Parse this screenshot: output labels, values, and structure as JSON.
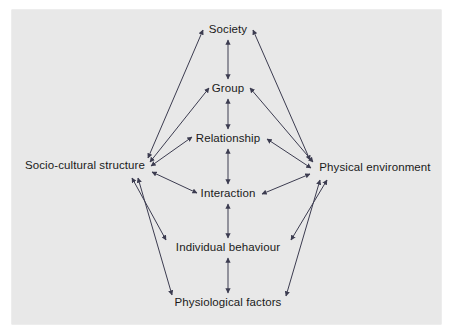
{
  "figure": {
    "type": "influence-diagram",
    "title": "",
    "background_color": "#e8e8e8",
    "page_color": "#ffffff",
    "line_color": "#3c3c50",
    "text_color": "#1a1a1a"
  },
  "nodes": [
    {
      "id": "society",
      "label": "Society",
      "x": 228,
      "y": 30,
      "column": "center"
    },
    {
      "id": "group",
      "label": "Group",
      "x": 228,
      "y": 89,
      "column": "center"
    },
    {
      "id": "relationship",
      "label": "Relationship",
      "x": 228,
      "y": 139,
      "column": "center"
    },
    {
      "id": "socio",
      "label": "Socio-cultural structure",
      "x": 85,
      "y": 166,
      "column": "left"
    },
    {
      "id": "physical",
      "label": "Physical environment",
      "x": 375,
      "y": 168,
      "column": "right"
    },
    {
      "id": "interaction",
      "label": "Interaction",
      "x": 228,
      "y": 194,
      "column": "center"
    },
    {
      "id": "individual",
      "label": "Individual behaviour",
      "x": 228,
      "y": 248,
      "column": "center"
    },
    {
      "id": "physiology",
      "label": "Physiological factors",
      "x": 228,
      "y": 303,
      "column": "center"
    }
  ],
  "edges": [
    {
      "from": "society",
      "to": "group",
      "arrow": "double",
      "kind": "vertical"
    },
    {
      "from": "group",
      "to": "relationship",
      "arrow": "double",
      "kind": "vertical"
    },
    {
      "from": "relationship",
      "to": "interaction",
      "arrow": "double",
      "kind": "vertical"
    },
    {
      "from": "interaction",
      "to": "individual",
      "arrow": "double",
      "kind": "vertical"
    },
    {
      "from": "individual",
      "to": "physiology",
      "arrow": "double",
      "kind": "vertical"
    },
    {
      "from": "socio",
      "to": "society",
      "arrow": "double",
      "kind": "diagonal"
    },
    {
      "from": "socio",
      "to": "group",
      "arrow": "double",
      "kind": "diagonal"
    },
    {
      "from": "socio",
      "to": "relationship",
      "arrow": "double",
      "kind": "diagonal"
    },
    {
      "from": "socio",
      "to": "interaction",
      "arrow": "double",
      "kind": "diagonal"
    },
    {
      "from": "socio",
      "to": "individual",
      "arrow": "double",
      "kind": "diagonal"
    },
    {
      "from": "socio",
      "to": "physiology",
      "arrow": "double",
      "kind": "diagonal"
    },
    {
      "from": "physical",
      "to": "society",
      "arrow": "double",
      "kind": "diagonal"
    },
    {
      "from": "physical",
      "to": "group",
      "arrow": "double",
      "kind": "diagonal"
    },
    {
      "from": "physical",
      "to": "relationship",
      "arrow": "double",
      "kind": "diagonal"
    },
    {
      "from": "physical",
      "to": "interaction",
      "arrow": "double",
      "kind": "diagonal"
    },
    {
      "from": "physical",
      "to": "individual",
      "arrow": "double",
      "kind": "diagonal"
    },
    {
      "from": "physical",
      "to": "physiology",
      "arrow": "double",
      "kind": "diagonal"
    }
  ],
  "geometry": {
    "lines": [
      {
        "name": "society-group",
        "x1": 228,
        "y1": 40,
        "x2": 228,
        "y2": 79
      },
      {
        "name": "group-relationship",
        "x1": 228,
        "y1": 99,
        "x2": 228,
        "y2": 129
      },
      {
        "name": "relationship-interaction",
        "x1": 228,
        "y1": 149,
        "x2": 228,
        "y2": 184
      },
      {
        "name": "interaction-individual",
        "x1": 228,
        "y1": 204,
        "x2": 228,
        "y2": 238
      },
      {
        "name": "individual-physiology",
        "x1": 228,
        "y1": 258,
        "x2": 228,
        "y2": 293
      },
      {
        "name": "socio-society",
        "x1": 148,
        "y1": 158,
        "x2": 203,
        "y2": 30
      },
      {
        "name": "socio-group",
        "x1": 150,
        "y1": 162,
        "x2": 209,
        "y2": 88
      },
      {
        "name": "socio-relationship",
        "x1": 151,
        "y1": 166,
        "x2": 192,
        "y2": 137
      },
      {
        "name": "socio-interaction",
        "x1": 152,
        "y1": 172,
        "x2": 197,
        "y2": 193
      },
      {
        "name": "socio-individual",
        "x1": 132,
        "y1": 178,
        "x2": 166,
        "y2": 240
      },
      {
        "name": "socio-physiology",
        "x1": 138,
        "y1": 178,
        "x2": 172,
        "y2": 295
      },
      {
        "name": "physical-society",
        "x1": 310,
        "y1": 160,
        "x2": 253,
        "y2": 30
      },
      {
        "name": "physical-group",
        "x1": 313,
        "y1": 162,
        "x2": 250,
        "y2": 88
      },
      {
        "name": "physical-relationship",
        "x1": 311,
        "y1": 168,
        "x2": 267,
        "y2": 139
      },
      {
        "name": "physical-interaction",
        "x1": 310,
        "y1": 174,
        "x2": 262,
        "y2": 194
      },
      {
        "name": "physical-individual",
        "x1": 327,
        "y1": 180,
        "x2": 291,
        "y2": 240
      },
      {
        "name": "physical-physiology",
        "x1": 320,
        "y1": 180,
        "x2": 286,
        "y2": 296
      }
    ]
  }
}
